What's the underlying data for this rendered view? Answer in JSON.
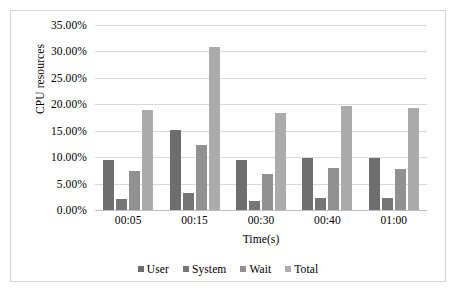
{
  "chart_data": {
    "type": "bar",
    "title": "",
    "xlabel": "Time(s)",
    "ylabel": "CPU resources",
    "categories": [
      "00:05",
      "00:15",
      "00:30",
      "00:40",
      "01:00"
    ],
    "series": [
      {
        "name": "User",
        "color": "#6e6e6e",
        "values": [
          9.5,
          15.2,
          9.4,
          9.9,
          9.8
        ]
      },
      {
        "name": "System",
        "color": "#767676",
        "values": [
          2.0,
          3.3,
          1.8,
          2.2,
          2.2
        ]
      },
      {
        "name": "Wait",
        "color": "#919191",
        "values": [
          7.3,
          12.3,
          6.8,
          8.0,
          7.8
        ]
      },
      {
        "name": "Total",
        "color": "#ababab",
        "values": [
          19.0,
          30.8,
          18.3,
          19.6,
          19.3
        ]
      }
    ],
    "ylim": [
      0,
      35
    ],
    "ytick_labels": [
      "35.00%",
      "30.00%",
      "25.00%",
      "20.00%",
      "15.00%",
      "10.00%",
      "5.00%",
      "0.00%"
    ],
    "ytick_values": [
      35,
      30,
      25,
      20,
      15,
      10,
      5,
      0
    ],
    "grid": true,
    "legend_position": "bottom",
    "units": "percent"
  }
}
